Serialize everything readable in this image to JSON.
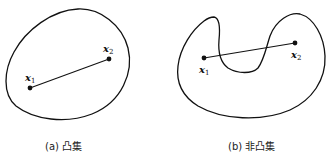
{
  "figure": {
    "panels": [
      {
        "id": "a",
        "caption": "(a) 凸集",
        "shape": "convex",
        "points": [
          {
            "name": "x",
            "sub": "1"
          },
          {
            "name": "x",
            "sub": "2"
          }
        ]
      },
      {
        "id": "b",
        "caption": "(b) 非凸集",
        "shape": "non-convex",
        "points": [
          {
            "name": "x",
            "sub": "1"
          },
          {
            "name": "x",
            "sub": "2"
          }
        ]
      }
    ],
    "colors": {
      "stroke": "#111111",
      "background": "#ffffff"
    }
  }
}
